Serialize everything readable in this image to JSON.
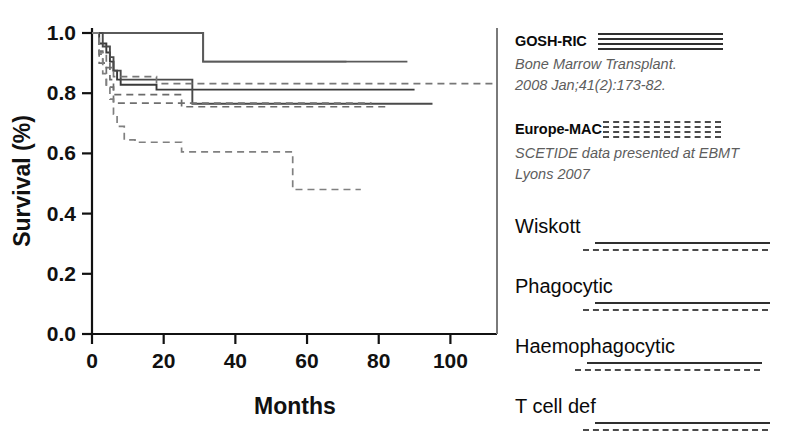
{
  "chart_data": {
    "type": "line",
    "title": "",
    "xlabel": "Months",
    "ylabel": "Survival (%)",
    "xlim": [
      0,
      113
    ],
    "ylim": [
      0.0,
      1.0
    ],
    "xticks": [
      0,
      20,
      40,
      60,
      80,
      100
    ],
    "xtick_labels": [
      "0",
      "20",
      "40",
      "60",
      "80",
      "100"
    ],
    "yticks": [
      0.0,
      0.2,
      0.4,
      0.6,
      0.8,
      1.0
    ],
    "ytick_labels": [
      "0.0",
      "0.2",
      "0.4",
      "0.6",
      "0.8",
      "1.0"
    ],
    "grid": false,
    "legend_position": "right",
    "curve_style": "kaplan-meier step",
    "series": [
      {
        "name": "Wiskott GOSH-RIC",
        "group": "GOSH-RIC",
        "condition": "Wiskott",
        "style": "solid",
        "color": "#6f6f6f",
        "x": [
          0,
          31,
          31,
          71
        ],
        "y": [
          1.0,
          1.0,
          0.905,
          0.905
        ],
        "note": "Top solid curve: 100% until month 31, then 90.5% out to month 71"
      },
      {
        "name": "Phagocytic GOSH-RIC",
        "group": "GOSH-RIC",
        "condition": "Phagocytic",
        "style": "solid",
        "color": "#5a5a5a",
        "x": [
          0,
          31,
          31,
          88
        ],
        "y": [
          1.0,
          1.0,
          0.905,
          0.905
        ],
        "note": "Second solid curve continues at 90.5% to month 88"
      },
      {
        "name": "Haemophagocytic GOSH-RIC",
        "group": "GOSH-RIC",
        "condition": "Haemophagocytic",
        "style": "solid",
        "color": "#3a3a3a",
        "x": [
          0,
          2,
          2,
          4,
          4,
          5,
          5,
          6,
          6,
          7,
          7,
          8,
          8,
          18,
          18,
          90
        ],
        "y": [
          1.0,
          1.0,
          0.965,
          0.965,
          0.935,
          0.935,
          0.905,
          0.905,
          0.875,
          0.875,
          0.845,
          0.845,
          0.828,
          0.828,
          0.812,
          0.812
        ],
        "note": "Bold solid stepped curve settling at about 81% to month 90"
      },
      {
        "name": "T cell def GOSH-RIC",
        "group": "GOSH-RIC",
        "condition": "T cell def",
        "style": "solid",
        "color": "#4a4a4a",
        "x": [
          0,
          3,
          3,
          5,
          5,
          6,
          6,
          8,
          8,
          28,
          28,
          95
        ],
        "y": [
          1.0,
          1.0,
          0.955,
          0.955,
          0.92,
          0.92,
          0.875,
          0.875,
          0.845,
          0.845,
          0.765,
          0.765
        ],
        "note": "Solid curve dropping to 76.5% at month 28, running to month 95"
      },
      {
        "name": "Wiskott Europe-MAC",
        "group": "Europe-MAC",
        "condition": "Wiskott",
        "style": "dashed",
        "color": "#777777",
        "x": [
          0,
          2,
          2,
          4,
          4,
          6,
          6,
          18,
          18,
          113
        ],
        "y": [
          1.0,
          1.0,
          0.93,
          0.93,
          0.885,
          0.885,
          0.855,
          0.855,
          0.832,
          0.832
        ],
        "note": "Dashed curve levelling at about 83% across the full axis"
      },
      {
        "name": "Phagocytic Europe-MAC",
        "group": "Europe-MAC",
        "condition": "Phagocytic",
        "style": "dashed",
        "color": "#6b6b6b",
        "x": [
          0,
          2,
          2,
          3,
          3,
          5,
          5,
          6,
          6,
          25,
          25,
          83
        ],
        "y": [
          1.0,
          1.0,
          0.94,
          0.94,
          0.9,
          0.9,
          0.845,
          0.845,
          0.795,
          0.795,
          0.755,
          0.755
        ],
        "note": "Dashed curve at about 79.5% falling to 75.5% at month 25"
      },
      {
        "name": "Haemophagocytic Europe-MAC",
        "group": "Europe-MAC",
        "condition": "Haemophagocytic",
        "style": "dashed",
        "color": "#707070",
        "x": [
          0,
          2,
          2,
          4,
          4,
          6,
          6,
          78
        ],
        "y": [
          1.0,
          1.0,
          0.9,
          0.9,
          0.82,
          0.82,
          0.767,
          0.767
        ],
        "note": "Dashed curve flat near 76.7%"
      },
      {
        "name": "T cell def Europe-MAC",
        "group": "Europe-MAC",
        "condition": "T cell def",
        "style": "dashed",
        "color": "#808080",
        "x": [
          0,
          2,
          2,
          3,
          3,
          4,
          4,
          5,
          5,
          6,
          6,
          7,
          7,
          9,
          9,
          12,
          12,
          25,
          25,
          56,
          56,
          75
        ],
        "y": [
          1.0,
          1.0,
          0.935,
          0.935,
          0.865,
          0.865,
          0.82,
          0.82,
          0.78,
          0.78,
          0.73,
          0.73,
          0.69,
          0.69,
          0.645,
          0.645,
          0.637,
          0.637,
          0.605,
          0.605,
          0.48,
          0.48
        ],
        "note": "Lowest dashed curve: steps down to 64%, 60.5% then 48% at month 56"
      }
    ]
  },
  "legend": {
    "groups": [
      {
        "id": "gosh-ric",
        "label": "GOSH-RIC",
        "sample_style": "solid",
        "sample_count": 4,
        "citation": "Bone Marrow Transplant.\n2008 Jan;41(2):173-82."
      },
      {
        "id": "europe-mac",
        "label": "Europe-MAC",
        "sample_style": "dashed",
        "sample_count": 4,
        "citation": "SCETIDE  data presented at  EBMT\nLyons 2007"
      }
    ],
    "conditions": [
      {
        "id": "wiskott",
        "label": "Wiskott"
      },
      {
        "id": "phagocytic",
        "label": "Phagocytic"
      },
      {
        "id": "haemophagocytic",
        "label": "Haemophagocytic"
      },
      {
        "id": "t-cell-def",
        "label": "T cell def"
      }
    ]
  },
  "colors": {
    "axis": "#111111",
    "solid_line": "#3a3a3a",
    "dashed_line": "#6b6b6b",
    "citation_text": "#5d5d5d",
    "background": "#ffffff"
  }
}
